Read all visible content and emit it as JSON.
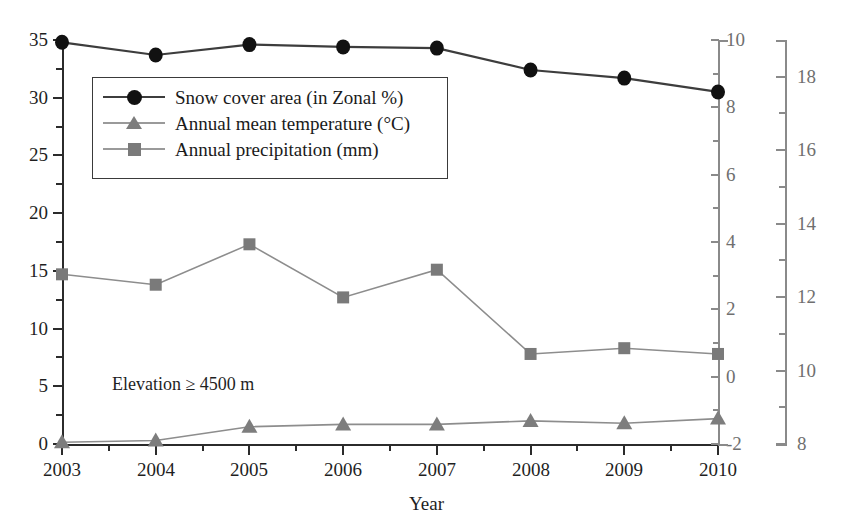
{
  "chart_data": {
    "type": "line",
    "title": "",
    "annotation": "Elevation ≥ 4500 m",
    "xlabel": "Year",
    "ylabel": "",
    "grid": false,
    "legend_position": "upper-left-inside",
    "categories": [
      "2003",
      "2004",
      "2005",
      "2006",
      "2007",
      "2008",
      "2009",
      "2010"
    ],
    "x": [
      2003,
      2004,
      2005,
      2006,
      2007,
      2008,
      2009,
      2010
    ],
    "axes": {
      "left": {
        "name": "Snow cover area (in Zonal %)",
        "ticks": [
          0,
          5,
          10,
          15,
          20,
          25,
          30,
          35
        ],
        "tick_labels": [
          "0",
          "5",
          "10",
          "15",
          "20",
          "25",
          "30",
          "35"
        ],
        "ylim": [
          0,
          35
        ],
        "minor_step": 2.5
      },
      "right_1": {
        "name": "Annual mean temperature (°C)",
        "ticks": [
          -2,
          0,
          2,
          4,
          6,
          8,
          10
        ],
        "tick_labels": [
          "-2",
          "0",
          "2",
          "4",
          "6",
          "8",
          "10"
        ],
        "ylim": [
          -2,
          10
        ],
        "minor_step": 1
      },
      "right_2": {
        "name": "Annual precipitation (mm)",
        "ticks": [
          8,
          10,
          12,
          14,
          16,
          18
        ],
        "tick_labels": [
          "8",
          "10",
          "12",
          "14",
          "16",
          "18"
        ],
        "ylim": [
          8,
          19
        ],
        "minor_step": 1
      }
    },
    "series": [
      {
        "name": "Snow cover area (in Zonal %)",
        "axis": "left",
        "marker": "circle",
        "color": "#111111",
        "line_color": "#3d3d3d",
        "values": [
          34.8,
          33.7,
          34.6,
          34.4,
          34.3,
          32.4,
          31.7,
          30.5
        ]
      },
      {
        "name": "Annual mean temperature (°C)",
        "axis": "right_1",
        "marker": "triangle",
        "color": "#7d7d7d",
        "line_color": "#8d8d8d",
        "values": [
          -1.95,
          -1.9,
          -1.45,
          -1.4,
          -1.4,
          -1.3,
          -1.4,
          -1.25
        ]
      },
      {
        "name": "Annual precipitation (mm)",
        "axis": "right_2",
        "marker": "square",
        "color": "#7a7a7a",
        "line_color": "#8d8d8d",
        "values": [
          12.65,
          12.55,
          13.6,
          12.25,
          12.95,
          10.5,
          10.6,
          10.5
        ]
      }
    ],
    "series_left_axis_plot_values": {
      "snow_cover": [
        34.8,
        33.7,
        34.6,
        34.4,
        34.3,
        32.4,
        31.7,
        30.5
      ],
      "precipitation_on_left_scale": [
        14.7,
        13.8,
        17.3,
        12.7,
        15.1,
        7.8,
        8.3,
        7.8
      ],
      "temperature_on_left_scale": [
        0.15,
        0.3,
        1.5,
        1.7,
        1.7,
        2.0,
        1.8,
        2.2
      ]
    }
  },
  "legend": {
    "entries": [
      {
        "label": "Snow cover area (in Zonal %)",
        "marker": "circle-marker",
        "color": "#111111"
      },
      {
        "label": "Annual mean temperature (°C)",
        "marker": "triangle-marker",
        "color": "#7d7d7d"
      },
      {
        "label": "Annual precipitation (mm)",
        "marker": "square-marker",
        "color": "#7a7a7a"
      }
    ]
  }
}
